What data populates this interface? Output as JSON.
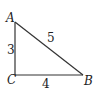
{
  "diagram": {
    "type": "right-triangle",
    "vertices": {
      "A": {
        "label": "A"
      },
      "B": {
        "label": "B"
      },
      "C": {
        "label": "C"
      }
    },
    "sides": {
      "AC": {
        "label": "3"
      },
      "CB": {
        "label": "4"
      },
      "AB": {
        "label": "5"
      }
    },
    "colors": {
      "stroke": "#333333",
      "text": "#222222",
      "background": "#ffffff"
    }
  }
}
